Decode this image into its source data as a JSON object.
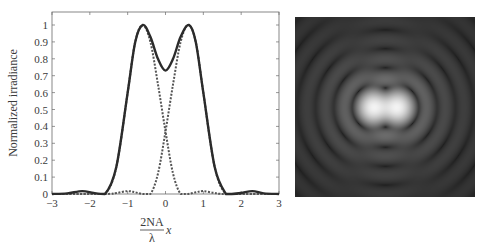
{
  "chart_data": [
    {
      "type": "line",
      "title": "",
      "xlabel": "2NA/λ x",
      "xlabel_parts": {
        "numerator": "2NA",
        "denominator": "λ",
        "variable": "x"
      },
      "ylabel": "Normalized irradiance",
      "xlim": [
        -3,
        3
      ],
      "ylim": [
        0,
        1.07
      ],
      "xticks": [
        -3,
        -2,
        -1,
        0,
        1,
        2,
        3
      ],
      "xtick_labels": [
        "−3",
        "−2",
        "−1",
        "0",
        "1",
        "2",
        "3"
      ],
      "yticks": [
        0,
        0.1,
        0.2,
        0.3,
        0.4,
        0.5,
        0.6,
        0.7,
        0.8,
        0.9,
        1
      ],
      "ytick_labels": [
        "0",
        "0.1",
        "0.2",
        "0.3",
        "0.4",
        "0.5",
        "0.6",
        "0.7",
        "0.8",
        "0.9",
        "1"
      ],
      "grid": false,
      "legend": null,
      "series": [
        {
          "name": "Sum (two-point irradiance)",
          "style": "solid",
          "color": "#2b2b2b",
          "x": [
            -3,
            -2.6,
            -2.2,
            -1.9,
            -1.6,
            -1.3,
            -1.0,
            -0.8,
            -0.6,
            -0.4,
            -0.2,
            0,
            0.2,
            0.4,
            0.62,
            0.8,
            1.0,
            1.3,
            1.6,
            1.75,
            2.0,
            2.3,
            2.6,
            3
          ],
          "y": [
            0.0,
            0.004,
            0.017,
            0.006,
            0.0,
            0.16,
            0.6,
            0.9,
            1.0,
            0.93,
            0.8,
            0.73,
            0.8,
            0.93,
            1.0,
            0.9,
            0.6,
            0.16,
            0.0,
            0.0,
            0.006,
            0.017,
            0.004,
            0.0
          ]
        },
        {
          "name": "Left point source",
          "style": "dashed",
          "color": "#555555",
          "x": [
            -3,
            -2.0,
            -1.6,
            -1.3,
            -1.0,
            -0.8,
            -0.6,
            -0.4,
            -0.2,
            0,
            0.2,
            0.4,
            0.6,
            0.8,
            1.0,
            1.3,
            1.6,
            3
          ],
          "y": [
            0.0,
            0.0,
            0.0,
            0.16,
            0.6,
            0.9,
            1.0,
            0.9,
            0.65,
            0.37,
            0.12,
            0.0,
            0.0,
            0.01,
            0.017,
            0.006,
            0.0,
            0.0
          ]
        },
        {
          "name": "Right point source",
          "style": "dashed",
          "color": "#555555",
          "x": [
            -3,
            -1.6,
            -1.3,
            -1.0,
            -0.8,
            -0.6,
            -0.4,
            -0.2,
            0,
            0.2,
            0.4,
            0.6,
            0.8,
            1.0,
            1.3,
            1.6,
            2.0,
            3
          ],
          "y": [
            0.0,
            0.0,
            0.006,
            0.017,
            0.01,
            0.0,
            0.0,
            0.12,
            0.37,
            0.65,
            0.9,
            1.0,
            0.9,
            0.6,
            0.16,
            0.0,
            0.0,
            0.0
          ]
        }
      ],
      "annotations": {
        "peak_positions": [
          -0.61,
          0.61
        ],
        "central_dip_value": 0.73,
        "crossing_value": 0.37
      }
    },
    {
      "type": "heatmap",
      "title": "",
      "description": "Grayscale image of two overlapping Airy patterns: bright elongated central lobe with concentric dark/gray rings",
      "background_color": "#1e1e1e",
      "peak_color": "#f2f2f2"
    }
  ]
}
